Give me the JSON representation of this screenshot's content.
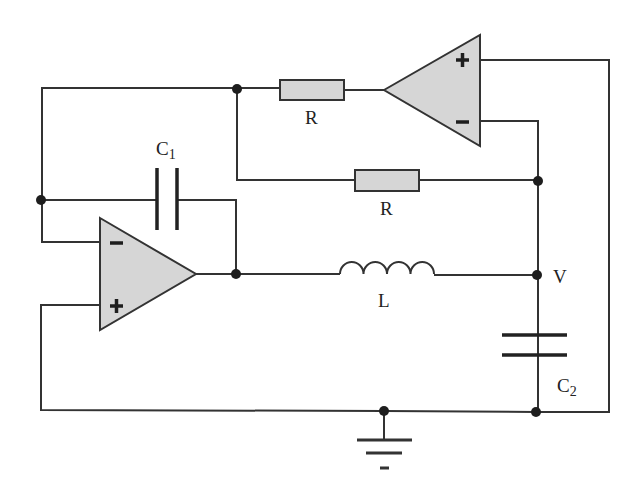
{
  "diagram": {
    "type": "circuit-schematic",
    "components": {
      "resistor_top": {
        "label": "R"
      },
      "resistor_mid": {
        "label": "R"
      },
      "capacitor_1": {
        "label": "C",
        "subscript": "1"
      },
      "capacitor_2": {
        "label": "C",
        "subscript": "2"
      },
      "inductor": {
        "label": "L"
      },
      "node_v": {
        "label": "V"
      },
      "opamp_top": {
        "plus": "+",
        "minus": "−"
      },
      "opamp_bottom": {
        "plus": "+",
        "minus": "−"
      }
    },
    "colors": {
      "wire": "#333333",
      "component_fill": "#d6d6d6",
      "junction": "#1e1e1e",
      "background": "#ffffff"
    }
  }
}
